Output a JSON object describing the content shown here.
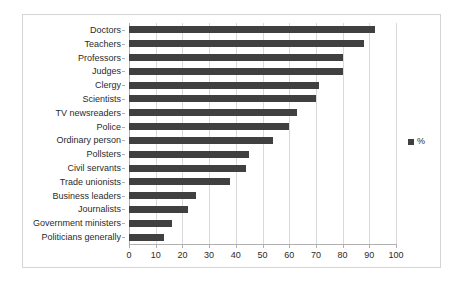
{
  "chart_data": {
    "type": "bar",
    "orientation": "horizontal",
    "title": "",
    "xlabel": "",
    "ylabel": "",
    "xlim": [
      0,
      100
    ],
    "xticks": [
      0,
      10,
      20,
      30,
      40,
      50,
      60,
      70,
      80,
      90,
      100
    ],
    "grid": true,
    "legend": [
      "%"
    ],
    "legend_position": "right",
    "categories": [
      "Doctors",
      "Teachers",
      "Professors",
      "Judges",
      "Clergy",
      "Scientists",
      "TV newsreaders",
      "Police",
      "Ordinary person",
      "Pollsters",
      "Civil servants",
      "Trade unionists",
      "Business leaders",
      "Journalists",
      "Government ministers",
      "Politicians generally"
    ],
    "values": [
      92,
      88,
      80,
      80,
      71,
      70,
      63,
      60,
      54,
      45,
      44,
      38,
      25,
      22,
      16,
      13
    ],
    "series": [
      {
        "name": "%",
        "values": [
          92,
          88,
          80,
          80,
          71,
          70,
          63,
          60,
          54,
          45,
          44,
          38,
          25,
          22,
          16,
          13
        ]
      }
    ]
  },
  "colors": {
    "bar": "#404040",
    "gridline": "#d9d9d9",
    "axis": "#b0b0b0",
    "frame_border": "#d4d4d4",
    "text": "#2b2b2b",
    "background": "#ffffff"
  },
  "legend": {
    "label": "%"
  }
}
